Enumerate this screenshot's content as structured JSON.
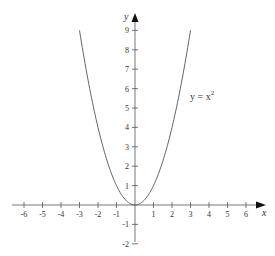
{
  "chart_data": {
    "type": "line",
    "title": "",
    "xlabel": "x",
    "ylabel": "y",
    "series": [
      {
        "name": "y = x^2",
        "label_text": "y = x",
        "label_exponent": "2",
        "x": [
          -3,
          -2.5,
          -2,
          -1.5,
          -1,
          -0.5,
          0,
          0.5,
          1,
          1.5,
          2,
          2.5,
          3
        ],
        "values": [
          9,
          6.25,
          4,
          2.25,
          1,
          0.25,
          0,
          0.25,
          1,
          2.25,
          4,
          6.25,
          9
        ]
      }
    ],
    "xlim": [
      -6.5,
      7
    ],
    "ylim": [
      -2.3,
      10
    ],
    "x_ticks": [
      "-6",
      "-5",
      "-4",
      "-3",
      "-2",
      "-1",
      "1",
      "2",
      "3",
      "4",
      "5",
      "6"
    ],
    "y_ticks": [
      "9",
      "8",
      "7",
      "6",
      "5",
      "4",
      "3",
      "2",
      "1",
      "-1",
      "-2"
    ],
    "grid": false,
    "legend": "inline label at (2.4, 5.6)",
    "colors": {
      "curve": "#555555",
      "axis": "#444444"
    }
  }
}
